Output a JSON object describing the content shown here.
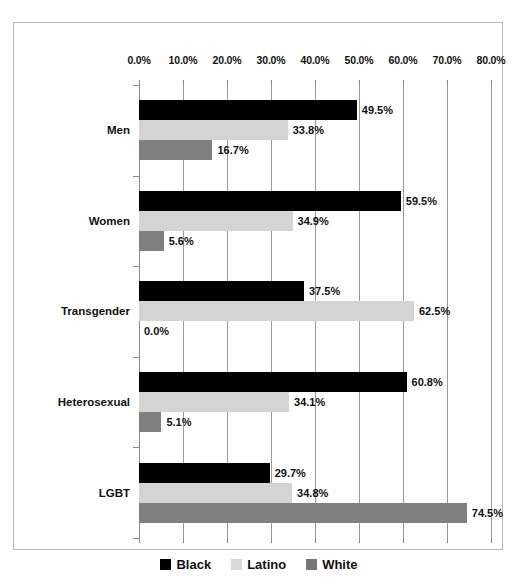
{
  "chart_data": {
    "type": "bar",
    "orientation": "horizontal",
    "title": "",
    "xlabel": "",
    "ylabel": "",
    "xlim": [
      0,
      80
    ],
    "xticks": [
      "0.0%",
      "10.0%",
      "20.0%",
      "30.0%",
      "40.0%",
      "50.0%",
      "60.0%",
      "70.0%",
      "80.0%"
    ],
    "xtick_values": [
      0,
      10,
      20,
      30,
      40,
      50,
      60,
      70,
      80
    ],
    "grid": true,
    "legend_position": "bottom",
    "categories": [
      "Men",
      "Women",
      "Transgender",
      "Heterosexual",
      "LGBT"
    ],
    "series": [
      {
        "name": "Black",
        "color": "#000000",
        "values": [
          49.5,
          59.5,
          37.5,
          60.8,
          29.7
        ],
        "labels": [
          "49.5%",
          "59.5%",
          "37.5%",
          "60.8%",
          "29.7%"
        ]
      },
      {
        "name": "Latino",
        "color": "#d4d4d4",
        "values": [
          33.8,
          34.9,
          62.5,
          34.1,
          34.8
        ],
        "labels": [
          "33.8%",
          "34.9%",
          "62.5%",
          "34.1%",
          "34.8%"
        ]
      },
      {
        "name": "White",
        "color": "#808080",
        "values": [
          16.7,
          5.6,
          0.0,
          5.1,
          74.5
        ],
        "labels": [
          "16.7%",
          "5.6%",
          "0.0%",
          "5.1%",
          "74.5%"
        ]
      }
    ]
  },
  "legend": {
    "items": [
      {
        "label": "Black",
        "swatch": "series-black"
      },
      {
        "label": "Latino",
        "swatch": "series-latino"
      },
      {
        "label": "White",
        "swatch": "series-white"
      }
    ]
  },
  "colors": {
    "black": "#000000",
    "latino": "#d4d4d4",
    "white": "#808080",
    "frame_border": "#b8b8b8",
    "gridline": "#9a9a9a",
    "text": "#111111"
  }
}
